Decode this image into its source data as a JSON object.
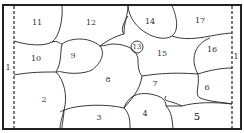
{
  "diagram": {
    "type": "region-map",
    "border_label": "1",
    "regions": [
      {
        "id": "2",
        "label": "2",
        "x": 44,
        "y": 100
      },
      {
        "id": "3",
        "label": "3",
        "x": 99,
        "y": 118
      },
      {
        "id": "4",
        "label": "4",
        "x": 145,
        "y": 114
      },
      {
        "id": "5",
        "label": "5",
        "x": 197,
        "y": 117
      },
      {
        "id": "6",
        "label": "6",
        "x": 207,
        "y": 88
      },
      {
        "id": "7",
        "label": "7",
        "x": 155,
        "y": 84
      },
      {
        "id": "8",
        "label": "8",
        "x": 108,
        "y": 80
      },
      {
        "id": "9",
        "label": "9",
        "x": 73,
        "y": 56
      },
      {
        "id": "10",
        "label": "10",
        "x": 36,
        "y": 59
      },
      {
        "id": "11",
        "label": "11",
        "x": 37,
        "y": 23
      },
      {
        "id": "12",
        "label": "12",
        "x": 91,
        "y": 23
      },
      {
        "id": "13",
        "label": "13",
        "x": 137,
        "y": 47
      },
      {
        "id": "14",
        "label": "14",
        "x": 150,
        "y": 22
      },
      {
        "id": "15",
        "label": "15",
        "x": 162,
        "y": 54
      },
      {
        "id": "16",
        "label": "16",
        "x": 212,
        "y": 50
      },
      {
        "id": "17",
        "label": "17",
        "x": 200,
        "y": 21
      }
    ],
    "side_labels": [
      {
        "side": "left",
        "label": "1",
        "x": 8,
        "y": 68
      },
      {
        "side": "right",
        "label": "1",
        "x": 234,
        "y": 57
      }
    ]
  }
}
